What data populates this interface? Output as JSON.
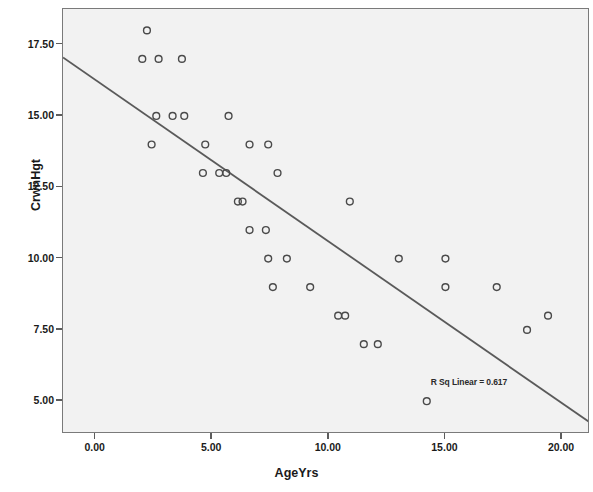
{
  "chart_data": {
    "type": "scatter",
    "title": "",
    "xlabel": "AgeYrs",
    "ylabel": "CrwnHgt",
    "xlim": [
      -1.4,
      21.2
    ],
    "ylim": [
      3.85,
      18.75
    ],
    "xticks": [
      "0.00",
      "5.00",
      "10.00",
      "15.00",
      "20.00"
    ],
    "xtick_values": [
      0,
      5,
      10,
      15,
      20
    ],
    "yticks": [
      "5.00",
      "7.50",
      "10.00",
      "12.50",
      "15.00",
      "17.50"
    ],
    "ytick_values": [
      5,
      7.5,
      10,
      12.5,
      15,
      17.5
    ],
    "grid": false,
    "legend": "none",
    "marker": "open-circle",
    "marker_color": "#4a4a4a",
    "plot_background": "#f2f2f2",
    "points": [
      {
        "x": 2.2,
        "y": 18.0
      },
      {
        "x": 2.0,
        "y": 17.0
      },
      {
        "x": 2.7,
        "y": 17.0
      },
      {
        "x": 3.7,
        "y": 17.0
      },
      {
        "x": 2.6,
        "y": 15.0
      },
      {
        "x": 3.3,
        "y": 15.0
      },
      {
        "x": 3.8,
        "y": 15.0
      },
      {
        "x": 5.7,
        "y": 15.0
      },
      {
        "x": 2.4,
        "y": 14.0
      },
      {
        "x": 4.7,
        "y": 14.0
      },
      {
        "x": 6.6,
        "y": 14.0
      },
      {
        "x": 7.4,
        "y": 14.0
      },
      {
        "x": 4.6,
        "y": 13.0
      },
      {
        "x": 5.3,
        "y": 13.0
      },
      {
        "x": 5.6,
        "y": 13.0
      },
      {
        "x": 7.8,
        "y": 13.0
      },
      {
        "x": 6.1,
        "y": 12.0
      },
      {
        "x": 6.3,
        "y": 12.0
      },
      {
        "x": 10.9,
        "y": 12.0
      },
      {
        "x": 6.6,
        "y": 11.0
      },
      {
        "x": 7.3,
        "y": 11.0
      },
      {
        "x": 7.4,
        "y": 10.0
      },
      {
        "x": 8.2,
        "y": 10.0
      },
      {
        "x": 13.0,
        "y": 10.0
      },
      {
        "x": 15.0,
        "y": 10.0
      },
      {
        "x": 7.6,
        "y": 9.0
      },
      {
        "x": 9.2,
        "y": 9.0
      },
      {
        "x": 15.0,
        "y": 9.0
      },
      {
        "x": 17.2,
        "y": 9.0
      },
      {
        "x": 10.4,
        "y": 8.0
      },
      {
        "x": 10.7,
        "y": 8.0
      },
      {
        "x": 19.4,
        "y": 8.0
      },
      {
        "x": 11.5,
        "y": 7.0
      },
      {
        "x": 12.1,
        "y": 7.0
      },
      {
        "x": 18.5,
        "y": 7.5
      },
      {
        "x": 14.2,
        "y": 5.0
      }
    ],
    "fit_line": {
      "type": "linear",
      "x_start": -1.4,
      "y_start": 17.05,
      "x_end": 21.2,
      "y_end": 4.25,
      "color": "#5a5a5a"
    },
    "annotation": {
      "text": "R Sq Linear = 0.617",
      "x": 16.3,
      "y": 5.6
    }
  }
}
